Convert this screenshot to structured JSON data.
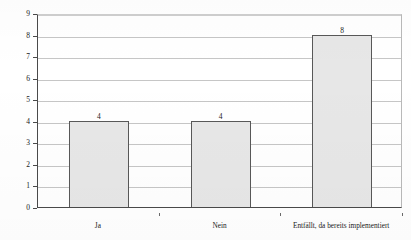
{
  "chart_data": {
    "type": "bar",
    "title": "",
    "xlabel": "",
    "ylabel": "Nennungen [N=16]",
    "categories": [
      "Ja",
      "Nein",
      "Entfällt, da bereits implementiert"
    ],
    "values": [
      4,
      4,
      8
    ],
    "value_labels": [
      "4",
      "4",
      "8"
    ],
    "ylim": [
      0,
      9
    ],
    "ytick_labels": [
      "0",
      "1",
      "2",
      "3",
      "4",
      "5",
      "6",
      "7",
      "8",
      "9"
    ],
    "ytick_values": [
      0,
      1,
      2,
      3,
      4,
      5,
      6,
      7,
      8,
      9
    ],
    "grid": true,
    "legend": false,
    "bar_fill_color": "#e7e7e7",
    "bar_border_color": "#585858",
    "gridline_color": "#c6c6c6",
    "axis_color": "#4a4a4a",
    "background_color": "#ffffff"
  }
}
